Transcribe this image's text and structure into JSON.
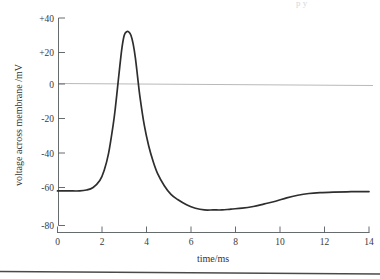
{
  "figure": {
    "background_color": "#ffffff",
    "trace_color": "#2e2e2e",
    "axis_color": "#555a5e",
    "zero_line_color": "#b9b9b9"
  },
  "chart_data": {
    "type": "line",
    "title": "",
    "subtitle": "",
    "xlabel": "time/ms",
    "ylabel": "voltage across membrane /mV",
    "xlim": [
      0,
      14
    ],
    "ylim": [
      -80,
      40
    ],
    "xticks": [
      0,
      2,
      4,
      6,
      8,
      10,
      12,
      14
    ],
    "xtick_labels": [
      "0",
      "2",
      "4",
      "6",
      "8",
      "10",
      "12",
      "14"
    ],
    "yticks": [
      40,
      20,
      0,
      -20,
      -40,
      -60,
      -80
    ],
    "ytick_labels": [
      "+40",
      "+20",
      "0",
      "-20",
      "-40",
      "-60",
      "-80"
    ],
    "grid": false,
    "legend": "none",
    "annotations": [
      {
        "name": "zero-reference-line",
        "value": 0,
        "style": "horizontal grey line across plot"
      }
    ],
    "series": [
      {
        "name": "membrane potential",
        "x": [
          0.0,
          0.5,
          1.0,
          1.3,
          1.6,
          1.9,
          2.1,
          2.3,
          2.5,
          2.6,
          2.7,
          2.8,
          2.9,
          3.0,
          3.1,
          3.2,
          3.3,
          3.4,
          3.5,
          3.6,
          3.7,
          3.9,
          4.1,
          4.3,
          4.5,
          4.8,
          5.1,
          5.4,
          5.8,
          6.2,
          6.6,
          7.0,
          7.4,
          7.8,
          8.3,
          8.8,
          9.3,
          9.8,
          10.3,
          10.8,
          11.3,
          11.8,
          12.4,
          13.0,
          13.6,
          14.0
        ],
        "y": [
          -60,
          -60,
          -60,
          -59.5,
          -58,
          -54,
          -48,
          -38,
          -22,
          -12,
          0,
          12,
          23,
          30,
          32,
          32,
          30,
          25,
          17,
          6,
          -5,
          -22,
          -34,
          -43,
          -50,
          -57,
          -62,
          -65,
          -68,
          -70,
          -71,
          -71,
          -71,
          -70.5,
          -70,
          -69,
          -67.5,
          -66,
          -64,
          -62.5,
          -61.5,
          -61,
          -60.7,
          -60.5,
          -60.4,
          -60.4
        ]
      }
    ],
    "features": {
      "resting_potential_mV": -60,
      "peak_potential_mV": 32,
      "peak_time_ms": 3.1,
      "threshold_crossing_time_ms": 2.7,
      "repolarisation_zero_crossing_time_ms": 3.65,
      "undershoot_minimum_mV": -71,
      "undershoot_minimum_time_ms": 7.2
    }
  },
  "page_artifacts": {
    "bottom_rule": "horizontal rule near bottom of page",
    "top_clipped_text": "clipped text fragment at top right"
  }
}
